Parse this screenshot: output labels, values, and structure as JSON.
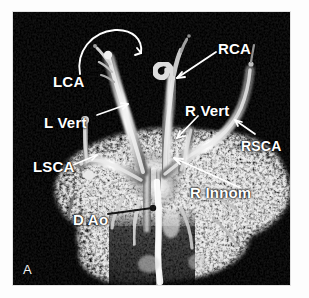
{
  "figure": {
    "panel_letter": "A",
    "modality": "mr-angiography-mip",
    "background_color": "#000000",
    "label_color": "#ffffff",
    "page_color": "#ffffff",
    "caption_sliver": ""
  },
  "labels": [
    {
      "id": "lca",
      "text": "LCA",
      "meaning": "left carotid artery",
      "arrow": "curved-hook-up-right"
    },
    {
      "id": "lvert",
      "text": "L Vert",
      "meaning": "left vertebral artery",
      "arrow": "straight-up-right"
    },
    {
      "id": "lsca",
      "text": "LSCA",
      "meaning": "left subclavian artery",
      "arrow": "straight-up-right"
    },
    {
      "id": "dao",
      "text": "D Ao",
      "meaning": "descending aorta",
      "arrow": "straight-right-dark"
    },
    {
      "id": "rca",
      "text": "RCA",
      "meaning": "right carotid artery",
      "arrow": "straight-down-left"
    },
    {
      "id": "rvert",
      "text": "R Vert",
      "meaning": "right vertebral artery",
      "arrow": "straight-down-left"
    },
    {
      "id": "rsca",
      "text": "RSCA",
      "meaning": "right subclavian artery",
      "arrow": "straight-up-left"
    },
    {
      "id": "rinnom",
      "text": "R Innom",
      "meaning": "right innominate artery",
      "arrow": "long-up-left"
    }
  ]
}
